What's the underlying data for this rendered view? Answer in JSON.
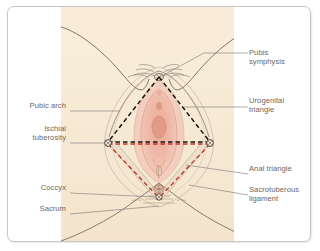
{
  "figure": {
    "name": "female-perineum-anatomy-diagram",
    "panel_background": "#f7ead7",
    "card_background": "#ffffff",
    "card_border_color": "#c9c6c2",
    "label_color": "#6d6560",
    "leader_line_color": "#8c8781",
    "urogenital_triangle_color": "#1a1a1a",
    "anal_triangle_color": "#c0392b",
    "sacrotuberous_ligament_color": "#b8a99a",
    "outline_color": "#6b5f57",
    "skin_color": "#f4e3ce",
    "mucosa_color": "#e8a898",
    "labia_color": "#f0c3b4"
  },
  "labels": {
    "right": [
      {
        "id": "pubis-symphysis",
        "text": "Pubis\nsymphysis"
      },
      {
        "id": "urogenital-triangle",
        "text": "Urogenital\ntriangle"
      },
      {
        "id": "anal-triangle",
        "text": "Anal triangle"
      },
      {
        "id": "sacrotuberous-ligament",
        "text": "Sacrotuberous\nligament"
      }
    ],
    "left": [
      {
        "id": "pubic-arch",
        "text": "Pubic arch"
      },
      {
        "id": "ischial-tuberosity",
        "text": "Ischial\ntuberosity"
      },
      {
        "id": "coccyx",
        "text": "Coccyx"
      },
      {
        "id": "sacrum",
        "text": "Sacrum"
      }
    ]
  }
}
